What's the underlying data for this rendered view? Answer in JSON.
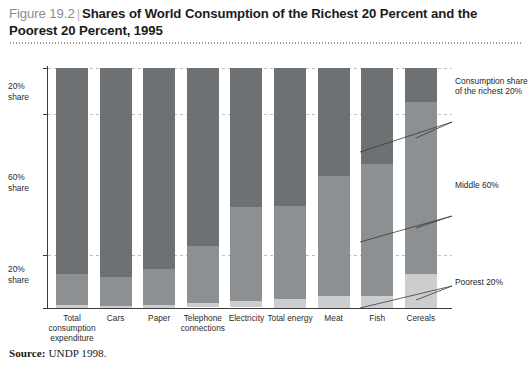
{
  "figure": {
    "number": "Figure 19.2",
    "divider": "|",
    "title": "Shares of World Consumption of the Richest 20 Percent and the Poorest 20 Percent, 1995"
  },
  "source": {
    "label": "Source:",
    "text": "UNDP 1998."
  },
  "axis": {
    "y_labels": [
      {
        "id": "rich",
        "text": "20%\nshare"
      },
      {
        "id": "middle",
        "text": "60%\nshare"
      },
      {
        "id": "poor",
        "text": "20%\nshare"
      }
    ],
    "y_label_rich_line1": "20%",
    "y_label_rich_line2": "share",
    "y_label_mid_line1": "60%",
    "y_label_mid_line2": "share",
    "y_label_poor_line1": "20%",
    "y_label_poor_line2": "share"
  },
  "annotations": {
    "richest": "Consumption share of the richest 20%",
    "middle": "Middle 60%",
    "poorest": "Poorest 20%"
  },
  "colors": {
    "richest": "#6e7173",
    "middle": "#8d9092",
    "poorest": "#cbcdce",
    "axis": "#3c3c3c",
    "gridline": "#bdbfc1",
    "figure_number": "#8a8d8f",
    "title_text": "#1b1b1b"
  },
  "chart_data": {
    "type": "bar",
    "subtype": "stacked-100-percent",
    "title": "Shares of World Consumption of the Richest 20 Percent and the Poorest 20 Percent, 1995",
    "xlabel": "",
    "ylabel": "",
    "ylim": [
      0,
      100
    ],
    "grid": true,
    "legend_position": "right-callouts",
    "categories": [
      "Total consumption expenditure",
      "Cars",
      "Paper",
      "Telephone connections",
      "Electricity",
      "Total energy",
      "Meat",
      "Fish",
      "Cereals"
    ],
    "series": [
      {
        "name": "Consumption share of the richest 20%",
        "color": "#6e7173",
        "values": [
          86,
          87,
          84,
          74,
          58,
          58,
          45,
          40,
          14
        ]
      },
      {
        "name": "Middle 60%",
        "color": "#8d9092",
        "values": [
          13,
          12,
          15,
          24,
          39,
          39,
          50,
          55,
          72
        ]
      },
      {
        "name": "Poorest 20%",
        "color": "#cbcdce",
        "values": [
          1.3,
          1,
          1.1,
          1.5,
          2.5,
          4,
          5,
          5,
          14
        ]
      }
    ],
    "ytick_bands": [
      {
        "label": "20% share",
        "range": [
          80,
          100
        ]
      },
      {
        "label": "60% share",
        "range": [
          20,
          80
        ]
      },
      {
        "label": "20% share",
        "range": [
          0,
          20
        ]
      }
    ]
  }
}
